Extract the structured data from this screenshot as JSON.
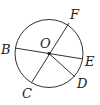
{
  "diagram": {
    "type": "circle-geometry",
    "stroke_color": "#333333",
    "circle": {
      "center": "O",
      "cx": 49,
      "cy": 53.5,
      "r": 34
    },
    "points": [
      {
        "name": "O",
        "x": 49,
        "y": 53.5,
        "label_x": 40,
        "label_y": 48
      },
      {
        "name": "B",
        "x": 15,
        "y": 48,
        "label_x": 1,
        "label_y": 54
      },
      {
        "name": "E",
        "x": 83,
        "y": 59,
        "label_x": 85,
        "label_y": 66
      },
      {
        "name": "F",
        "x": 69,
        "y": 23,
        "label_x": 70,
        "label_y": 19
      },
      {
        "name": "C",
        "x": 32,
        "y": 82,
        "label_x": 22,
        "label_y": 98
      },
      {
        "name": "D",
        "x": 75,
        "y": 77,
        "label_x": 77,
        "label_y": 88
      }
    ],
    "segments": [
      {
        "id": "BE",
        "from": "B",
        "to": "E",
        "kind": "diameter"
      },
      {
        "id": "CF",
        "from": "C",
        "to": "F",
        "kind": "diameter"
      },
      {
        "id": "OD",
        "from": "O",
        "to": "D",
        "kind": "radius"
      }
    ],
    "labels": {
      "O": "O",
      "B": "B",
      "E": "E",
      "F": "F",
      "C": "C",
      "D": "D"
    }
  }
}
